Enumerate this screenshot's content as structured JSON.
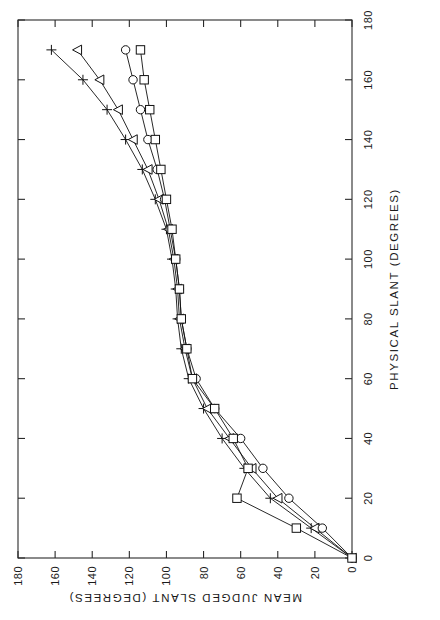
{
  "figure": {
    "orientation": "rotated-90-ccw",
    "background_color": "#ffffff",
    "ink_color": "#111111"
  },
  "chart_data": {
    "type": "line",
    "title": "",
    "subtitle": "",
    "xlabel": "PHYSICAL SLANT (DEGREES)",
    "ylabel": "MEAN JUDGED SLANT (DEGREES)",
    "xlim": [
      0,
      180
    ],
    "ylim": [
      0,
      180
    ],
    "xticks": [
      0,
      20,
      40,
      60,
      80,
      100,
      120,
      140,
      160,
      180
    ],
    "yticks": [
      0,
      20,
      40,
      60,
      80,
      100,
      120,
      140,
      160,
      180
    ],
    "xticklabels": [
      "0",
      "20",
      "40",
      "60",
      "80",
      "100",
      "120",
      "140",
      "160",
      "180"
    ],
    "yticklabels": [
      "0",
      "20",
      "40",
      "60",
      "80",
      "100",
      "120",
      "140",
      "160",
      "180"
    ],
    "grid": false,
    "legend": "none",
    "x": [
      0,
      10,
      20,
      30,
      40,
      50,
      60,
      70,
      80,
      90,
      100,
      110,
      120,
      130,
      140,
      150,
      160,
      170
    ],
    "series": [
      {
        "name": "series-plus",
        "marker": "plus",
        "values": [
          0,
          22,
          44,
          58,
          70,
          80,
          88,
          92,
          94,
          95,
          97,
          100,
          106,
          113,
          122,
          132,
          145,
          162
        ]
      },
      {
        "name": "series-triangle",
        "marker": "triangle",
        "values": [
          0,
          20,
          40,
          54,
          66,
          78,
          86,
          90,
          93,
          94,
          96,
          99,
          104,
          110,
          118,
          126,
          136,
          148
        ]
      },
      {
        "name": "series-circle",
        "marker": "circle",
        "values": [
          0,
          16,
          34,
          48,
          60,
          74,
          84,
          89,
          92,
          93,
          95,
          98,
          101,
          105,
          110,
          114,
          118,
          122
        ]
      },
      {
        "name": "series-square",
        "marker": "square",
        "values": [
          0,
          30,
          62,
          56,
          64,
          74,
          86,
          89,
          92,
          93,
          95,
          97,
          100,
          103,
          106,
          109,
          112,
          114
        ]
      }
    ]
  }
}
